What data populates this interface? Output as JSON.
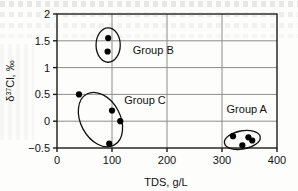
{
  "chart_data": {
    "type": "scatter",
    "title": "",
    "xlabel": "TDS, g/L",
    "ylabel": "δ³⁷Cl, ‰",
    "ylabel_parts": {
      "delta": "δ",
      "superscript": "37",
      "rest": "Cl, ‰"
    },
    "xlim": [
      0,
      400
    ],
    "ylim": [
      -0.5,
      2
    ],
    "xticks": [
      0,
      100,
      200,
      300,
      400
    ],
    "yticks": [
      -0.5,
      0,
      0.5,
      1,
      1.5,
      2
    ],
    "xtick_labels": [
      "0",
      "100",
      "200",
      "300",
      "400"
    ],
    "ytick_labels": [
      "-0.5",
      "0",
      "0.5",
      "1",
      "1.5",
      "2"
    ],
    "grid": true,
    "grid_color": "#8c8c8c",
    "axis_color": "#1a1a1a",
    "marker_color": "#000000",
    "legend": "none",
    "series": [
      {
        "name": "Group B",
        "points": [
          {
            "x": 93,
            "y": 1.55
          },
          {
            "x": 92,
            "y": 1.3
          }
        ]
      },
      {
        "name": "Group C",
        "points": [
          {
            "x": 40,
            "y": 0.5
          },
          {
            "x": 100,
            "y": 0.2
          },
          {
            "x": 115,
            "y": 0.0
          },
          {
            "x": 95,
            "y": -0.42
          }
        ]
      },
      {
        "name": "Group A",
        "points": [
          {
            "x": 320,
            "y": -0.28
          },
          {
            "x": 337,
            "y": -0.45
          },
          {
            "x": 348,
            "y": -0.3
          },
          {
            "x": 355,
            "y": -0.36
          }
        ]
      }
    ],
    "annotations": [
      {
        "label": "Group B",
        "x": 175,
        "y": 1.25,
        "group": "B"
      },
      {
        "label": "Group C",
        "x": 160,
        "y": 0.32,
        "group": "C"
      },
      {
        "label": "Group A",
        "x": 345,
        "y": 0.16,
        "group": "A"
      }
    ],
    "group_outlines": [
      {
        "group": "B",
        "cx": 93,
        "cy": 1.42,
        "rx": 22,
        "ry": 0.32,
        "rotation": 0
      },
      {
        "group": "C",
        "cx": 79,
        "cy": 0.03,
        "rx": 36,
        "ry": 0.54,
        "rotation": -28
      },
      {
        "group": "A",
        "cx": 337,
        "cy": -0.35,
        "rx": 33,
        "ry": 0.17,
        "rotation": -10
      }
    ]
  }
}
